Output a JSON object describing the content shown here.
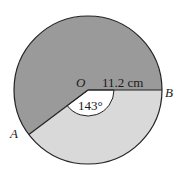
{
  "diagram": {
    "center_label": "O",
    "point_a_label": "A",
    "point_b_label": "B",
    "radius_label": "11.2 cm",
    "angle_label": "143°",
    "colors": {
      "major_sector": "#9a9a9a",
      "minor_sector": "#d9d9d9",
      "angle_arc_fill": "#ffffff",
      "stroke": "#222222"
    }
  }
}
